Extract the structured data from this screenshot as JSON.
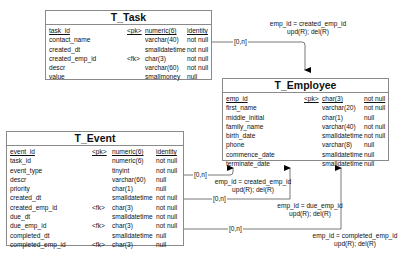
{
  "tables": {
    "task": {
      "name": "T_Task",
      "columns": [
        {
          "name": "task_id",
          "key": "<pk>",
          "type": "numeric(6)",
          "nullability": "identity",
          "underline": true
        },
        {
          "name": "contact_name",
          "key": "",
          "type": "varchar(40)",
          "nullability": "not null"
        },
        {
          "name": "created_dt",
          "key": "",
          "type": "smalldatetime",
          "nullability": "not null"
        },
        {
          "name": "created_emp_id",
          "key": "<fk>",
          "type": "char(3)",
          "nullability": "not null"
        },
        {
          "name": "descr",
          "key": "",
          "type": "varchar(60)",
          "nullability": "not null"
        },
        {
          "name": "value",
          "key": "",
          "type": "smallmoney",
          "nullability": "null"
        }
      ]
    },
    "employee": {
      "name": "T_Employee",
      "columns": [
        {
          "name": "emp_id",
          "key": "<pk>",
          "type": "char(3)",
          "nullability": "not null",
          "underline": true
        },
        {
          "name": "first_name",
          "key": "",
          "type": "varchar(20)",
          "nullability": "not null"
        },
        {
          "name": "middle_initial",
          "key": "",
          "type": "char(1)",
          "nullability": "null"
        },
        {
          "name": "family_name",
          "key": "",
          "type": "varchar(40)",
          "nullability": "not null"
        },
        {
          "name": "birth_date",
          "key": "",
          "type": "smalldatetime",
          "nullability": "not null"
        },
        {
          "name": "phone",
          "key": "",
          "type": "varchar(8)",
          "nullability": "null"
        },
        {
          "name": "commence_date",
          "key": "",
          "type": "smalldatetime",
          "nullability": "null"
        },
        {
          "name": "terminate_date",
          "key": "",
          "type": "smalldatetime",
          "nullability": "null"
        }
      ]
    },
    "event": {
      "name": "T_Event",
      "columns": [
        {
          "name": "event_id",
          "key": "<pk>",
          "type": "numeric(6)",
          "nullability": "identity",
          "underline": true
        },
        {
          "name": "task_id",
          "key": "",
          "type": "numeric(6)",
          "nullability": "not null"
        },
        {
          "name": "event_type",
          "key": "",
          "type": "tinyint",
          "nullability": "not null"
        },
        {
          "name": "descr",
          "key": "",
          "type": "varchar(60)",
          "nullability": "null"
        },
        {
          "name": "priority",
          "key": "",
          "type": "char(1)",
          "nullability": "null"
        },
        {
          "name": "created_dt",
          "key": "",
          "type": "smalldatetime",
          "nullability": "not null"
        },
        {
          "name": "created_emp_id",
          "key": "<fk>",
          "type": "char(3)",
          "nullability": "not null"
        },
        {
          "name": "due_dt",
          "key": "",
          "type": "smalldatetime",
          "nullability": "not null"
        },
        {
          "name": "due_emp_id",
          "key": "<fk>",
          "type": "char(3)",
          "nullability": "not null"
        },
        {
          "name": "completed_dt",
          "key": "",
          "type": "smalldatetime",
          "nullability": "null"
        },
        {
          "name": "completed_emp_id",
          "key": "<fk>",
          "type": "char(3)",
          "nullability": "null"
        }
      ]
    }
  },
  "relationships": [
    {
      "from": "T_Task",
      "to": "T_Employee",
      "cardinality": "[0,n]",
      "join": "emp_id = created_emp_id",
      "rules": "upd(R); del(R)"
    },
    {
      "from": "T_Event",
      "to": "T_Employee",
      "cardinality": "[0,n]",
      "join": "emp_id = created_emp_id",
      "rules": "upd(R); del(R)"
    },
    {
      "from": "T_Event",
      "to": "T_Employee",
      "cardinality": "[0,n]",
      "join": "emp_id = due_emp_id",
      "rules": "upd(R); del(R)"
    },
    {
      "from": "T_Event",
      "to": "T_Employee",
      "cardinality": "[0,n]",
      "join": "emp_id = completed_emp_id",
      "rules": "upd(R); del(R)"
    }
  ]
}
